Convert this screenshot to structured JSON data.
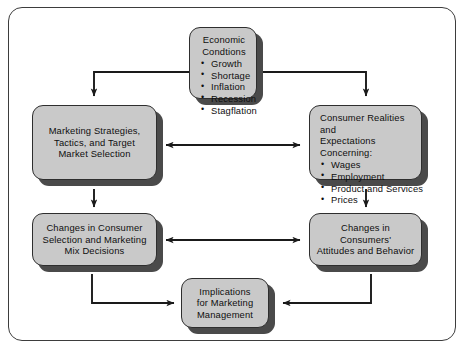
{
  "diagram": {
    "colors": {
      "node_fill": "#c9c9c9",
      "node_border": "#2e2e2e",
      "node_shadow": "#4a4a4a",
      "frame_border": "#3d3d3d",
      "background": "#ffffff",
      "connector": "#1a1a1a"
    },
    "nodes": {
      "economic": {
        "title": "Economic",
        "title2": "Condtions",
        "bullets": [
          "Growth",
          "Shortage",
          "Inflation",
          "Recession",
          "Stagflation"
        ]
      },
      "consumer_realities": {
        "title": "Consumer Realities and",
        "title2": "Expectations Concerning:",
        "bullets": [
          "Wages",
          "Employment",
          "Product and Services",
          "Prices"
        ]
      },
      "marketing_strategies": {
        "line1": "Marketing Strategies,",
        "line2": "Tactics, and Target",
        "line3": "Market Selection"
      },
      "changes_selection": {
        "line1": "Changes in Consumer",
        "line2": "Selection and Marketing",
        "line3": "Mix Decisions"
      },
      "changes_attitudes": {
        "line1": "Changes in Consumers'",
        "line2": "Attitudes and Behavior"
      },
      "implications": {
        "line1": "Implications",
        "line2": "for Marketing",
        "line3": "Management"
      }
    },
    "connectors": [
      {
        "name": "economic-to-marketing",
        "style": "elbow-left-down",
        "arrowheads": "end"
      },
      {
        "name": "economic-to-consumer-realities",
        "style": "elbow-right-down",
        "arrowheads": "end"
      },
      {
        "name": "marketing-to-consumer-realities",
        "style": "horizontal",
        "arrowheads": "both"
      },
      {
        "name": "marketing-to-changes-selection",
        "style": "vertical-down",
        "arrowheads": "end"
      },
      {
        "name": "consumer-realities-to-changes-attitudes",
        "style": "vertical-down",
        "arrowheads": "end"
      },
      {
        "name": "changes-selection-to-changes-attitudes",
        "style": "horizontal",
        "arrowheads": "both"
      },
      {
        "name": "changes-selection-to-implications",
        "style": "elbow-down-right",
        "arrowheads": "end"
      },
      {
        "name": "changes-attitudes-to-implications",
        "style": "elbow-down-left",
        "arrowheads": "end"
      }
    ]
  }
}
